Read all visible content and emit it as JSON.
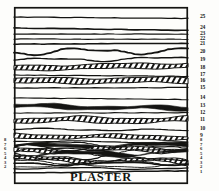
{
  "figure": {
    "caption": "PLASTER",
    "frame": {
      "x": 14,
      "y": 7,
      "width": 174,
      "height": 177
    },
    "ink_color": "#141412",
    "background_color": "#fdfdfb"
  },
  "chart_data": {
    "type": "diagram",
    "subtype": "stratigraphic-cross-section",
    "title": "",
    "xlabel": "",
    "ylabel": "",
    "orientation": "horizontal-layers",
    "layer_count": 25,
    "caption": "PLASTER",
    "numbering_direction": "bottom-to-top",
    "right_labels": [
      "25",
      "24",
      "23",
      "22",
      "21",
      "20",
      "19",
      "18",
      "17",
      "16",
      "15",
      "14",
      "13",
      "12",
      "11",
      "10",
      "9",
      "8",
      "7",
      "6",
      "5",
      "4",
      "3",
      "2",
      "1"
    ],
    "left_labels": [
      "8",
      "7",
      "6",
      "5",
      "4",
      "3",
      "2"
    ],
    "layers": [
      {
        "id": 25,
        "label": "25",
        "y": 17,
        "style": "thin-line",
        "thickness": 1.3,
        "wave": 0.0
      },
      {
        "id": 24,
        "label": "24",
        "y": 28,
        "style": "thin-line",
        "thickness": 1.6,
        "wave": 0.0
      },
      {
        "id": 23,
        "label": "23",
        "y": 34,
        "style": "thin-line",
        "thickness": 1.2,
        "wave": 0.0
      },
      {
        "id": 22,
        "label": "22",
        "y": 39,
        "style": "thin-line",
        "thickness": 1.1,
        "wave": 0.0
      },
      {
        "id": 21,
        "label": "21",
        "y": 44,
        "style": "thin-line",
        "thickness": 1.5,
        "wave": 0.0
      },
      {
        "id": 20,
        "label": "20",
        "y": 52,
        "style": "wavy-line",
        "thickness": 1.8,
        "wave": 2.6
      },
      {
        "id": 19,
        "label": "19",
        "y": 60,
        "style": "wavy-line",
        "thickness": 1.4,
        "wave": 1.6
      },
      {
        "id": 18,
        "label": "18",
        "y": 68,
        "style": "hatched-band",
        "thickness": 4.6,
        "wave": 0.8
      },
      {
        "id": 17,
        "label": "17",
        "y": 75,
        "style": "thin-line",
        "thickness": 1.2,
        "wave": 0.0
      },
      {
        "id": 16,
        "label": "16",
        "y": 81,
        "style": "hatched-band",
        "thickness": 5.0,
        "wave": 0.9
      },
      {
        "id": 15,
        "label": "15",
        "y": 88,
        "style": "thin-line",
        "thickness": 1.2,
        "wave": 0.0
      },
      {
        "id": 14,
        "label": "14",
        "y": 98,
        "style": "thin-line",
        "thickness": 1.1,
        "wave": 0.0
      },
      {
        "id": 13,
        "label": "13",
        "y": 106,
        "style": "solid-black",
        "thickness": 3.4,
        "wave": 1.2
      },
      {
        "id": 12,
        "label": "12",
        "y": 113,
        "style": "thin-line",
        "thickness": 1.1,
        "wave": 0.0
      },
      {
        "id": 11,
        "label": "11",
        "y": 120,
        "style": "hatched-band",
        "thickness": 4.8,
        "wave": 1.4
      },
      {
        "id": 10,
        "label": "10",
        "y": 129,
        "style": "thin-line",
        "thickness": 1.3,
        "wave": 0.8
      },
      {
        "id": 9,
        "label": "9",
        "y": 136,
        "style": "hatched-band",
        "thickness": 3.6,
        "wave": 1.0
      },
      {
        "id": 8,
        "label": "8",
        "y": 141,
        "style": "thin-line",
        "thickness": 1.2,
        "wave": 0.6
      },
      {
        "id": 7,
        "label": "7",
        "y": 146,
        "style": "solid-black",
        "thickness": 2.2,
        "wave": 1.6
      },
      {
        "id": 6,
        "label": "6",
        "y": 150,
        "style": "hatched-band",
        "thickness": 3.0,
        "wave": 2.0
      },
      {
        "id": 5,
        "label": "5",
        "y": 155,
        "style": "solid-black",
        "thickness": 2.4,
        "wave": 2.4
      },
      {
        "id": 4,
        "label": "4",
        "y": 159,
        "style": "hatched-band",
        "thickness": 2.8,
        "wave": 2.2
      },
      {
        "id": 3,
        "label": "3",
        "y": 164,
        "style": "thin-line",
        "thickness": 1.6,
        "wave": 1.4
      },
      {
        "id": 2,
        "label": "2",
        "y": 168,
        "style": "thin-line",
        "thickness": 1.3,
        "wave": 0.8
      },
      {
        "id": 1,
        "label": "1",
        "y": 173,
        "style": "thin-line",
        "thickness": 1.5,
        "wave": 0.0
      }
    ]
  }
}
